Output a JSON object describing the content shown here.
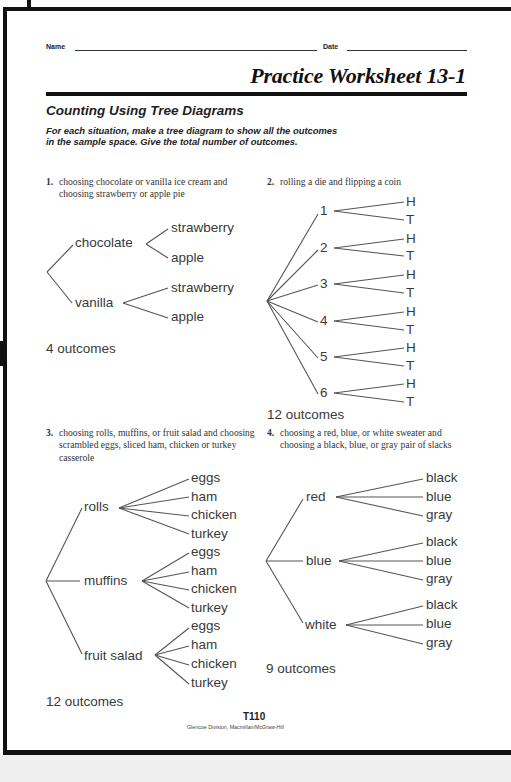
{
  "header": {
    "name_label": "Name",
    "date_label": "Date",
    "title": "Practice Worksheet 13-1"
  },
  "section": {
    "title": "Counting Using Tree Diagrams",
    "instructions": "For each situation, make a tree diagram to show all the outcomes in the sample space. Give the total number of outcomes."
  },
  "problems": [
    {
      "number": "1.",
      "text": "choosing chocolate or vanilla ice cream and choosing strawberry or apple pie",
      "branches": [
        {
          "label": "chocolate",
          "leaves": [
            "strawberry",
            "apple"
          ]
        },
        {
          "label": "vanilla",
          "leaves": [
            "strawberry",
            "apple"
          ]
        }
      ],
      "outcomes": "4 outcomes"
    },
    {
      "number": "2.",
      "text": "rolling a die and flipping a coin",
      "branches": [
        {
          "label": "1",
          "leaves": [
            "H",
            "T"
          ]
        },
        {
          "label": "2",
          "leaves": [
            "H",
            "T"
          ]
        },
        {
          "label": "3",
          "leaves": [
            "H",
            "T"
          ]
        },
        {
          "label": "4",
          "leaves": [
            "H",
            "T"
          ]
        },
        {
          "label": "5",
          "leaves": [
            "H",
            "T"
          ]
        },
        {
          "label": "6",
          "leaves": [
            "H",
            "T"
          ]
        }
      ],
      "outcomes": "12 outcomes"
    },
    {
      "number": "3.",
      "text": "choosing rolls, muffins, or fruit salad and choosing scrambled eggs, sliced ham, chicken or turkey casserole",
      "branches": [
        {
          "label": "rolls",
          "leaves": [
            "eggs",
            "ham",
            "chicken",
            "turkey"
          ]
        },
        {
          "label": "muffins",
          "leaves": [
            "eggs",
            "ham",
            "chicken",
            "turkey"
          ]
        },
        {
          "label": "fruit salad",
          "leaves": [
            "eggs",
            "ham",
            "chicken",
            "turkey"
          ]
        }
      ],
      "outcomes": "12 outcomes"
    },
    {
      "number": "4.",
      "text": "choosing a red, blue, or white sweater and choosing a black, blue, or gray pair of slacks",
      "branches": [
        {
          "label": "red",
          "leaves": [
            "black",
            "blue",
            "gray"
          ]
        },
        {
          "label": "blue",
          "leaves": [
            "black",
            "blue",
            "gray"
          ]
        },
        {
          "label": "white",
          "leaves": [
            "black",
            "blue",
            "gray"
          ]
        }
      ],
      "outcomes": "9 outcomes"
    }
  ],
  "footer": {
    "page": "T110",
    "credit": "Glencoe Division, Macmillan/McGraw-Hill"
  }
}
